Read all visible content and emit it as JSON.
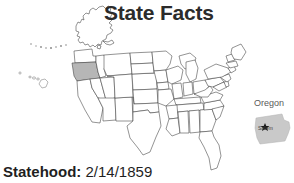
{
  "page": {
    "title": "State Facts",
    "background_color": "#ffffff"
  },
  "map": {
    "name": "united-states-map",
    "highlighted_state": "Oregon",
    "highlight_color": "#b6b6b6",
    "outline_color": "#3a3a3a",
    "fill_color": "#ffffff",
    "includes_alaska": true,
    "includes_hawaii": true
  },
  "inset": {
    "state_label": "Oregon",
    "capital_label": "Salem",
    "shape_fill": "#c9c9c9",
    "capital_marker": "star-marker"
  },
  "fact": {
    "label": "Statehood:",
    "value": "2/14/1859"
  }
}
